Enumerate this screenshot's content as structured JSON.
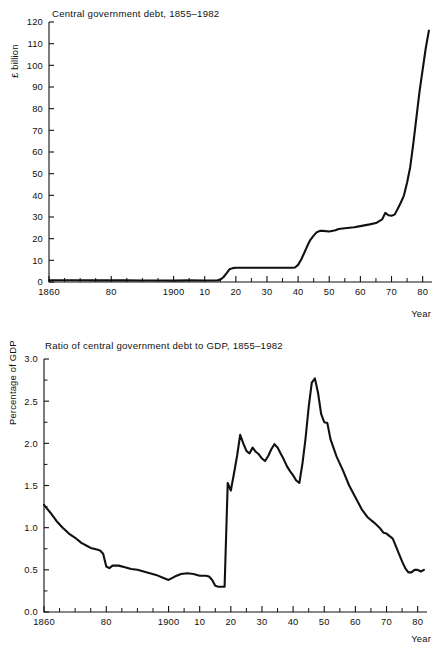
{
  "page": {
    "background": "#ffffff",
    "ink": "#111111",
    "width": 439,
    "height": 652
  },
  "chart_data": [
    {
      "id": "central-government-debt",
      "type": "line",
      "title": "Central government debt, 1855–1982",
      "xlabel": "Year",
      "ylabel": "£ billion",
      "xlim": [
        1860,
        1983
      ],
      "ylim": [
        0,
        120
      ],
      "grid": false,
      "legend": "none",
      "ytick_labels": [
        "0",
        "10",
        "20",
        "30",
        "40",
        "50",
        "60",
        "70",
        "80",
        "90",
        "100",
        "110",
        "120"
      ],
      "ytick_values": [
        0,
        10,
        20,
        30,
        40,
        50,
        60,
        70,
        80,
        90,
        100,
        110,
        120
      ],
      "xtick_labels": [
        "1860",
        "80",
        "1900",
        "10",
        "20",
        "30",
        "40",
        "50",
        "60",
        "70",
        "80"
      ],
      "xtick_values": [
        1860,
        1880,
        1900,
        1910,
        1920,
        1930,
        1940,
        1950,
        1960,
        1970,
        1980
      ],
      "xtick_minor_values": [
        1865,
        1870,
        1875,
        1885,
        1890,
        1895,
        1905,
        1915,
        1925,
        1935,
        1945,
        1955,
        1965,
        1975
      ],
      "x": [
        1860,
        1865,
        1870,
        1875,
        1880,
        1885,
        1890,
        1895,
        1900,
        1905,
        1910,
        1913,
        1914,
        1915,
        1916,
        1917,
        1918,
        1919,
        1920,
        1922,
        1925,
        1930,
        1935,
        1938,
        1939,
        1940,
        1941,
        1942,
        1943,
        1944,
        1945,
        1946,
        1947,
        1948,
        1950,
        1952,
        1953,
        1955,
        1958,
        1960,
        1963,
        1965,
        1967,
        1968,
        1969,
        1970,
        1971,
        1972,
        1973,
        1974,
        1975,
        1976,
        1977,
        1978,
        1979,
        1980,
        1981,
        1982
      ],
      "y": [
        0.8,
        0.8,
        0.8,
        0.77,
        0.76,
        0.74,
        0.69,
        0.66,
        0.63,
        0.76,
        0.71,
        0.71,
        0.71,
        1.1,
        2.2,
        4.0,
        5.9,
        6.4,
        6.6,
        6.6,
        6.6,
        6.6,
        6.6,
        6.6,
        6.7,
        7.9,
        10.4,
        13.5,
        16.8,
        19.6,
        21.4,
        23.0,
        23.6,
        23.6,
        23.3,
        23.9,
        24.5,
        24.8,
        25.3,
        25.8,
        26.6,
        27.2,
        28.9,
        31.9,
        30.8,
        30.6,
        31.1,
        33.8,
        36.7,
        40.0,
        45.9,
        53.0,
        64.0,
        76.0,
        88.0,
        98.0,
        108.0,
        116.0
      ]
    },
    {
      "id": "ratio-debt-to-gdp",
      "type": "line",
      "title": "Ratio of central government debt to GDP, 1855–1982",
      "xlabel": "Year",
      "ylabel": "Percentage of GDP",
      "xlim": [
        1860,
        1983
      ],
      "ylim": [
        0.0,
        3.0
      ],
      "grid": false,
      "legend": "none",
      "ytick_labels": [
        "0.0",
        "0.5",
        "1.0",
        "1.5",
        "2.0",
        "2.5",
        "3.0"
      ],
      "ytick_values": [
        0.0,
        0.5,
        1.0,
        1.5,
        2.0,
        2.5,
        3.0
      ],
      "ytick_minor_values": [
        0.25,
        0.75,
        1.25,
        1.75,
        2.25,
        2.75
      ],
      "xtick_labels": [
        "1860",
        "80",
        "1900",
        "10",
        "20",
        "30",
        "40",
        "50",
        "60",
        "70",
        "80"
      ],
      "xtick_values": [
        1860,
        1880,
        1900,
        1910,
        1920,
        1930,
        1940,
        1950,
        1960,
        1970,
        1980
      ],
      "xtick_minor_values": [
        1865,
        1870,
        1875,
        1885,
        1890,
        1895,
        1905,
        1915,
        1925,
        1935,
        1945,
        1955,
        1965,
        1975
      ],
      "x": [
        1860,
        1862,
        1864,
        1866,
        1868,
        1870,
        1872,
        1874,
        1875,
        1876,
        1877,
        1878,
        1879,
        1880,
        1881,
        1882,
        1884,
        1886,
        1888,
        1890,
        1892,
        1894,
        1896,
        1898,
        1900,
        1902,
        1904,
        1906,
        1908,
        1910,
        1912,
        1913,
        1914,
        1915,
        1916,
        1918,
        1919,
        1920,
        1921,
        1922,
        1923,
        1924,
        1925,
        1926,
        1927,
        1928,
        1929,
        1930,
        1931,
        1932,
        1933,
        1934,
        1935,
        1936,
        1937,
        1938,
        1939,
        1940,
        1941,
        1942,
        1943,
        1944,
        1945,
        1946,
        1947,
        1948,
        1949,
        1950,
        1951,
        1952,
        1954,
        1956,
        1958,
        1960,
        1962,
        1964,
        1966,
        1968,
        1969,
        1970,
        1971,
        1972,
        1973,
        1974,
        1975,
        1976,
        1977,
        1978,
        1979,
        1980,
        1981,
        1982
      ],
      "y": [
        1.27,
        1.18,
        1.08,
        1.0,
        0.93,
        0.88,
        0.82,
        0.78,
        0.76,
        0.75,
        0.74,
        0.73,
        0.69,
        0.54,
        0.52,
        0.55,
        0.55,
        0.53,
        0.51,
        0.5,
        0.48,
        0.46,
        0.44,
        0.41,
        0.38,
        0.42,
        0.45,
        0.46,
        0.45,
        0.43,
        0.43,
        0.42,
        0.38,
        0.31,
        0.3,
        0.3,
        1.53,
        1.44,
        1.64,
        1.85,
        2.1,
        2.0,
        1.91,
        1.88,
        1.95,
        1.9,
        1.87,
        1.82,
        1.79,
        1.85,
        1.93,
        1.99,
        1.95,
        1.88,
        1.81,
        1.73,
        1.67,
        1.62,
        1.56,
        1.53,
        1.76,
        2.06,
        2.43,
        2.72,
        2.77,
        2.6,
        2.35,
        2.25,
        2.24,
        2.05,
        1.84,
        1.68,
        1.5,
        1.36,
        1.22,
        1.12,
        1.06,
        0.99,
        0.94,
        0.93,
        0.9,
        0.87,
        0.78,
        0.69,
        0.6,
        0.52,
        0.47,
        0.47,
        0.5,
        0.5,
        0.48,
        0.5
      ]
    }
  ]
}
